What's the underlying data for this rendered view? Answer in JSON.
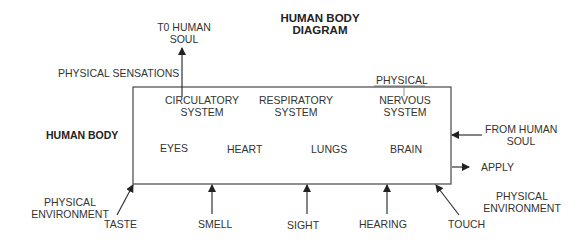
{
  "title": {
    "line1": "HUMAN BODY",
    "line2": "DIAGRAM"
  },
  "box_label": "HUMAN BODY",
  "top": {
    "to_soul": {
      "line1": "T0 HUMAN",
      "line2": "SOUL"
    },
    "physical_sensations": "PHYSICAL SENSATIONS",
    "physical": "PHYSICAL"
  },
  "systems": [
    {
      "line1": "CIRCULATORY",
      "line2": "SYSTEM"
    },
    {
      "line1": "RESPIRATORY",
      "line2": "SYSTEM"
    },
    {
      "line1": "NERVOUS",
      "line2": "SYSTEM"
    }
  ],
  "organs": [
    "EYES",
    "HEART",
    "LUNGS",
    "BRAIN"
  ],
  "right": {
    "from_soul": {
      "line1": "FROM HUMAN",
      "line2": "SOUL"
    },
    "apply": "APPLY",
    "physical_environment": {
      "line1": "PHYSICAL",
      "line2": "ENVIRONMENT"
    }
  },
  "left": {
    "physical_environment": {
      "line1": "PHYSICAL",
      "line2": "ENVIRONMENT"
    }
  },
  "senses": [
    "TASTE",
    "SMELL",
    "SIGHT",
    "HEARING",
    "TOUCH"
  ],
  "colors": {
    "line": "#4a4a4a",
    "text": "#333333"
  }
}
